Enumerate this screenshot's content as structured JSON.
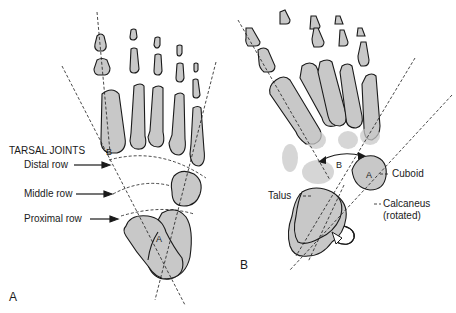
{
  "figure": {
    "panel_a": {
      "label": "A",
      "heading": "TARSAL JOINTS",
      "rows": [
        "Distal row",
        "Middle row",
        "Proximal row"
      ],
      "axis_markers": [
        "A",
        "B"
      ]
    },
    "panel_b": {
      "label": "B",
      "bones": [
        "Cuboid",
        "Talus",
        "Calcaneus",
        "(rotated)"
      ],
      "axis_markers": [
        "A",
        "B"
      ]
    },
    "colors": {
      "bone_fill": "#c8c8c8",
      "outline": "#1a1a1a",
      "background": "#ffffff"
    }
  }
}
